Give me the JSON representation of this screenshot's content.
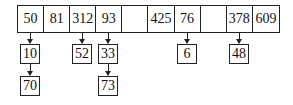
{
  "diagram": {
    "type": "hash table with separate chaining",
    "table": [
      "50",
      "81",
      "312",
      "93",
      "",
      "425",
      "76",
      "",
      "378",
      "609"
    ],
    "chains": [
      {
        "slot": 0,
        "nodes": [
          "10",
          "70"
        ]
      },
      {
        "slot": 2,
        "nodes": [
          "52"
        ]
      },
      {
        "slot": 3,
        "nodes": [
          "33",
          "73"
        ]
      },
      {
        "slot": 6,
        "nodes": [
          "6"
        ]
      },
      {
        "slot": 8,
        "nodes": [
          "48"
        ]
      }
    ]
  }
}
